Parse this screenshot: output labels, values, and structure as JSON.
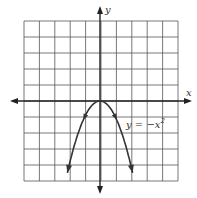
{
  "chart_data": {
    "type": "line",
    "title": "",
    "xlabel": "x",
    "ylabel": "y",
    "xlim": [
      -5,
      5
    ],
    "ylim": [
      -5,
      5
    ],
    "grid": true,
    "series": [
      {
        "name": "y = -x^2",
        "label": "y = −x",
        "label_exp": "2",
        "x": [
          -2.1,
          -1.5,
          -1,
          -0.5,
          0,
          0.5,
          1,
          1.5,
          2.1
        ],
        "y": [
          -4.41,
          -2.25,
          -1,
          -0.25,
          0,
          -0.25,
          -1,
          -2.25,
          -4.41
        ]
      }
    ]
  },
  "colors": {
    "grid": "#444444",
    "axis": "#222222",
    "curve": "#333333"
  }
}
